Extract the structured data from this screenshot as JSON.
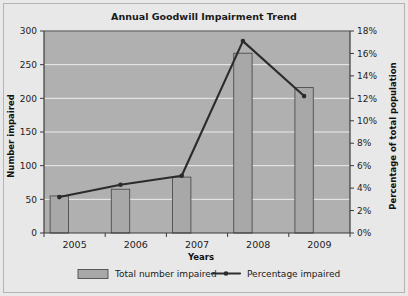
{
  "chart_data": {
    "type": "bar",
    "title": "Annual Goodwill Impairment Trend",
    "categories": [
      "2005",
      "2006",
      "2007",
      "2008",
      "2009"
    ],
    "xlabel": "Years",
    "ylabel": "Number impaired",
    "y2label": "Percentage of total population",
    "ylim": [
      0,
      300
    ],
    "yticks": [
      "0",
      "50",
      "100",
      "150",
      "200",
      "250",
      "300"
    ],
    "ytick_values": [
      0,
      50,
      100,
      150,
      200,
      250,
      300
    ],
    "y2lim": [
      0,
      18
    ],
    "y2ticks": [
      "0%",
      "2%",
      "4%",
      "6%",
      "8%",
      "10%",
      "12%",
      "14%",
      "16%",
      "18%"
    ],
    "y2tick_values": [
      0,
      2,
      4,
      6,
      8,
      10,
      12,
      14,
      16,
      18
    ],
    "grid": true,
    "legend_position": "bottom",
    "series": [
      {
        "name": "Total number impaired",
        "kind": "bar",
        "axis": "left",
        "values": [
          55,
          65,
          83,
          267,
          216
        ]
      },
      {
        "name": "Percentage impaired",
        "kind": "line",
        "axis": "right",
        "values": [
          3.2,
          4.3,
          5.1,
          17.1,
          12.2
        ]
      }
    ]
  },
  "legend": {
    "items": [
      {
        "label": "Total number impaired",
        "marker": "bar-swatch"
      },
      {
        "label": "Percentage impaired",
        "marker": "line-with-point"
      }
    ]
  },
  "colors": {
    "plot_background": "#b0b0b0",
    "page_background": "#e8e8e8",
    "bar_fill": "#a8a8a8",
    "bar_stroke": "#4d4d4d",
    "line": "#2b2b2b",
    "gridline": "#ededed",
    "axis": "#3b3b3b"
  }
}
